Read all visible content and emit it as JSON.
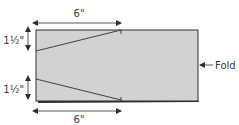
{
  "diagram": {
    "colors": {
      "panel_fill": "#d2d2d2",
      "stroke": "#2f2f2f",
      "text": "#3a3a3a",
      "background": "#ffffff"
    },
    "dimensions": {
      "top_width": "6\"",
      "bottom_width": "6\"",
      "upper_height": "1½\"",
      "lower_height": "1½\""
    },
    "callout": {
      "label": "Fold"
    }
  }
}
